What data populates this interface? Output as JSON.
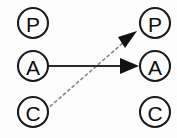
{
  "diagram": {
    "title": "",
    "background_color": "#fdfdfd",
    "node_stroke_color": "#1a1a1a",
    "node_fill_color": "#ffffff",
    "label_color": "#0d0d0d",
    "solid_edge_color": "#2b2b2b",
    "dotted_edge_color": "#8c8c8c",
    "arrowhead_color": "#111111",
    "left_column": {
      "name": "left-column",
      "nodes": [
        {
          "id": "left-p",
          "label": "P",
          "cx": 33,
          "cy": 23,
          "r": 15
        },
        {
          "id": "left-a",
          "label": "A",
          "cx": 33,
          "cy": 66,
          "r": 15
        },
        {
          "id": "left-c",
          "label": "C",
          "cx": 33,
          "cy": 112,
          "r": 15
        }
      ]
    },
    "right_column": {
      "name": "right-column",
      "nodes": [
        {
          "id": "right-p",
          "label": "P",
          "cx": 155,
          "cy": 23,
          "r": 15
        },
        {
          "id": "right-a",
          "label": "A",
          "cx": 155,
          "cy": 66,
          "r": 15
        },
        {
          "id": "right-c",
          "label": "C",
          "cx": 155,
          "cy": 112,
          "r": 15
        }
      ]
    },
    "edges": [
      {
        "id": "edge-a-to-a",
        "style": "solid",
        "from": "left-a",
        "to": "right-a",
        "x1": 49,
        "y1": 66,
        "x2": 124,
        "y2": 66,
        "arrow_tip_x": 139,
        "arrow_tip_y": 66,
        "label": ""
      },
      {
        "id": "edge-c-to-p",
        "style": "dotted",
        "from": "left-c",
        "to": "right-p",
        "x1": 46,
        "y1": 110,
        "x2": 124,
        "y2": 42,
        "arrow_tip_x": 137,
        "arrow_tip_y": 31,
        "label": ""
      }
    ]
  }
}
